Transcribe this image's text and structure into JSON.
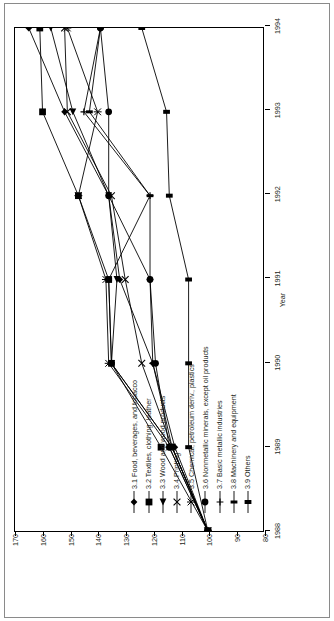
{
  "chart_data": {
    "type": "line",
    "title": "",
    "xlabel": "Year",
    "ylabel": "Index 1993 = 100",
    "x": [
      1988,
      1989,
      1990,
      1991,
      1992,
      1993,
      1994
    ],
    "xticklabels": [
      "1988",
      "1989",
      "1990",
      "1991",
      "1992",
      "1993",
      "1994"
    ],
    "yticklabels": [
      "80",
      "90",
      "100",
      "110",
      "120",
      "130",
      "140",
      "150",
      "160",
      "170"
    ],
    "ylim": [
      80,
      170
    ],
    "yticks": [
      80,
      90,
      100,
      110,
      120,
      130,
      140,
      150,
      160,
      170
    ],
    "grid": false,
    "legend_position": "inside-lower-left",
    "series": [
      {
        "name": "3.1 Food, beverages, and tobacco",
        "marker": "diamond",
        "values": [
          100,
          112,
          120,
          132,
          136,
          152,
          165
        ]
      },
      {
        "name": "3.2 Textiles, clothing, leather",
        "marker": "square",
        "values": [
          100,
          117,
          135,
          136,
          147,
          160,
          161
        ]
      },
      {
        "name": "3.3 Wood and wood products",
        "marker": "triangle",
        "values": [
          100,
          113,
          135,
          133,
          136,
          149,
          157
        ]
      },
      {
        "name": "3.4 Printing",
        "marker": "x",
        "values": [
          100,
          113,
          124,
          130,
          135,
          151,
          152
        ]
      },
      {
        "name": "3.5 Chemical, petroleum deriv., plastics",
        "marker": "asterisk",
        "values": [
          100,
          114,
          136,
          137,
          147,
          140,
          151
        ]
      },
      {
        "name": "3.6 Nonmetallic minerals, except oil products",
        "marker": "circle",
        "values": [
          100,
          114,
          119,
          121,
          136,
          136,
          139
        ]
      },
      {
        "name": "3.7 Basic metallic industries",
        "marker": "plus",
        "values": [
          100,
          113,
          120,
          121,
          121,
          145,
          139
        ]
      },
      {
        "name": "3.8 Machinery and equipment",
        "marker": "bar",
        "values": [
          100,
          113,
          135,
          136,
          121,
          143,
          139
        ]
      },
      {
        "name": "3.9 Others",
        "marker": "bar2",
        "values": [
          100,
          107,
          107,
          107,
          114,
          115,
          124
        ]
      }
    ]
  },
  "axes": {
    "x_axis_title": "Year",
    "y_axis_title": "Index 1993 = 100"
  }
}
